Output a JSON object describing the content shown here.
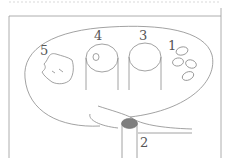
{
  "diagram": {
    "type": "labeled schematic cross-section",
    "labels": {
      "l1": "1",
      "l2": "2",
      "l3": "3",
      "l4": "4",
      "l5": "5"
    },
    "parts": [
      {
        "label": "1",
        "description": "cluster of four small ovals"
      },
      {
        "label": "2",
        "description": "vertical tube with gray filled top"
      },
      {
        "label": "3",
        "description": "vertical cylinder (open)"
      },
      {
        "label": "4",
        "description": "vertical cylinder with small circle inside top"
      },
      {
        "label": "5",
        "description": "irregular blob shape"
      }
    ],
    "colors": {
      "line": "#8a8a8a",
      "fill_gray": "#808080",
      "background": "#ffffff"
    }
  }
}
